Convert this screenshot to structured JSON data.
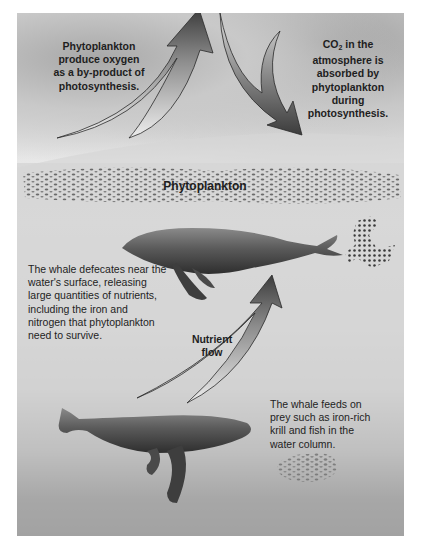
{
  "diagram": {
    "labels": {
      "oxygen": "Phytoplankton produce oxygen as a by-product of photosynthesis.",
      "oxygen_lines": [
        "Phytoplankton",
        "produce oxygen",
        "as a by-product of",
        "photosynthesis."
      ],
      "co2_prefix": "CO",
      "co2_sub": "2",
      "co2_suffix": " in the",
      "co2_lines": [
        "atmosphere is",
        "absorbed by",
        "phytoplankton",
        "during",
        "photosynthesis."
      ],
      "phytoplankton": "Phytoplankton",
      "defecate_lines": [
        "The whale defecates near the",
        "water's surface, releasing",
        "large quantities of nutrients,",
        "including the iron and",
        "nitrogen that phytoplankton",
        "need to survive."
      ],
      "nutrient_lines": [
        "Nutrient",
        "flow"
      ],
      "feeds_lines": [
        "The whale feeds on",
        "prey such as iron-rich",
        "krill and fish in the",
        "water column."
      ]
    },
    "icons": [
      "up-arrow-oxygen",
      "down-arrow-co2",
      "nutrient-flow-arrow",
      "upper-whale",
      "lower-whale",
      "phytoplankton-band",
      "fecal-plume",
      "krill-swarm"
    ],
    "colors": {
      "arrow_dark": "#3c3c3c",
      "arrow_light": "#e8e8e8",
      "text": "#1e1e1e",
      "whale": "#4a4a4a",
      "deep_water": "#2a2a2a"
    }
  }
}
